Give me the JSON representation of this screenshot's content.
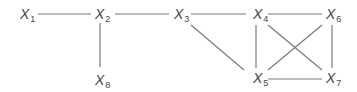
{
  "diagram": {
    "type": "undirected-graph",
    "nodes": [
      {
        "id": "X1",
        "base": "X",
        "sub": "1",
        "x": 20,
        "y": 19
      },
      {
        "id": "X2",
        "base": "X",
        "sub": "2",
        "x": 95,
        "y": 19
      },
      {
        "id": "X3",
        "base": "X",
        "sub": "3",
        "x": 174,
        "y": 19
      },
      {
        "id": "X4",
        "base": "X",
        "sub": "4",
        "x": 253,
        "y": 19
      },
      {
        "id": "X5",
        "base": "X",
        "sub": "5",
        "x": 253,
        "y": 83
      },
      {
        "id": "X6",
        "base": "X",
        "sub": "6",
        "x": 326,
        "y": 19
      },
      {
        "id": "X7",
        "base": "X",
        "sub": "7",
        "x": 326,
        "y": 83
      },
      {
        "id": "X8",
        "base": "X",
        "sub": "8",
        "x": 95,
        "y": 85
      }
    ],
    "edges": [
      {
        "from": "X1",
        "to": "X2",
        "x1": 38,
        "y1": 14,
        "x2": 91,
        "y2": 14
      },
      {
        "from": "X2",
        "to": "X3",
        "x1": 115,
        "y1": 14,
        "x2": 169,
        "y2": 14
      },
      {
        "from": "X2",
        "to": "X8",
        "x1": 100,
        "y1": 23,
        "x2": 100,
        "y2": 67
      },
      {
        "from": "X3",
        "to": "X4",
        "x1": 191,
        "y1": 14,
        "x2": 246,
        "y2": 14
      },
      {
        "from": "X4",
        "to": "X6",
        "x1": 268,
        "y1": 14,
        "x2": 322,
        "y2": 14
      },
      {
        "from": "X3",
        "to": "X5",
        "x1": 191,
        "y1": 25,
        "x2": 244,
        "y2": 70
      },
      {
        "from": "X4",
        "to": "X5",
        "x1": 256,
        "y1": 25,
        "x2": 256,
        "y2": 68
      },
      {
        "from": "X6",
        "to": "X7",
        "x1": 332,
        "y1": 25,
        "x2": 332,
        "y2": 68
      },
      {
        "from": "X4",
        "to": "X7",
        "x1": 268,
        "y1": 25,
        "x2": 322,
        "y2": 70
      },
      {
        "from": "X6",
        "to": "X5",
        "x1": 322,
        "y1": 25,
        "x2": 268,
        "y2": 70
      },
      {
        "from": "X5",
        "to": "X7",
        "x1": 268,
        "y1": 79,
        "x2": 322,
        "y2": 79
      }
    ]
  }
}
